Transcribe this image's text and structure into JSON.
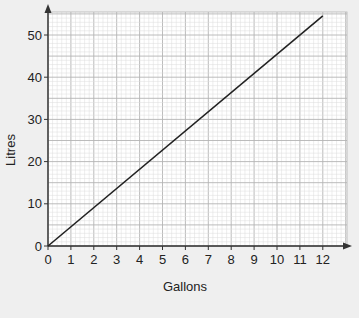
{
  "chart_data": {
    "type": "line",
    "title": "",
    "xlabel": "Gallons",
    "ylabel": "Litres",
    "xlim": [
      0,
      13
    ],
    "ylim": [
      0,
      55
    ],
    "x_ticks": [
      0,
      1,
      2,
      3,
      4,
      5,
      6,
      7,
      8,
      9,
      10,
      11,
      12
    ],
    "y_ticks": [
      0,
      10,
      20,
      30,
      40,
      50
    ],
    "grid": {
      "on": true,
      "major_x": 1,
      "minor_x": 0.2,
      "major_y": 5,
      "minor_y": 1
    },
    "series": [
      {
        "name": "Litres vs Gallons",
        "x": [
          0,
          12
        ],
        "y": [
          0,
          54.55
        ],
        "color": "#222222"
      }
    ],
    "legend": null
  },
  "colors": {
    "background": "#efefef",
    "grid_bg": "#ffffff",
    "grid_minor": "#dcdcdc",
    "grid_major": "#b4b4b4",
    "axis": "#333333",
    "line": "#222222"
  }
}
